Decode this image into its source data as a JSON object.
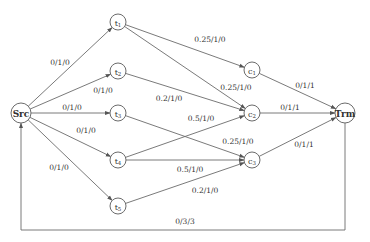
{
  "diagram": {
    "type": "flow-network",
    "nodes": [
      {
        "id": "Src",
        "label": "Src",
        "sub": "",
        "x": 21,
        "y": 113,
        "r": 10,
        "bold": true
      },
      {
        "id": "t1",
        "label": "t",
        "sub": "1",
        "x": 118,
        "y": 22,
        "r": 8
      },
      {
        "id": "t2",
        "label": "t",
        "sub": "2",
        "x": 118,
        "y": 71,
        "r": 8
      },
      {
        "id": "t3",
        "label": "t",
        "sub": "3",
        "x": 118,
        "y": 113,
        "r": 8
      },
      {
        "id": "t4",
        "label": "t",
        "sub": "4",
        "x": 118,
        "y": 160,
        "r": 8
      },
      {
        "id": "t5",
        "label": "t",
        "sub": "5",
        "x": 118,
        "y": 206,
        "r": 8
      },
      {
        "id": "c1",
        "label": "c",
        "sub": "1",
        "x": 252,
        "y": 70,
        "r": 8
      },
      {
        "id": "c2",
        "label": "c",
        "sub": "2",
        "x": 252,
        "y": 113,
        "r": 8
      },
      {
        "id": "c3",
        "label": "c",
        "sub": "3",
        "x": 252,
        "y": 160,
        "r": 8
      },
      {
        "id": "Trm",
        "label": "Trm",
        "sub": "",
        "x": 345,
        "y": 113,
        "r": 10,
        "bold": true
      }
    ],
    "edges": [
      {
        "from": "Src",
        "to": "t1",
        "label": "0/1/0",
        "lx": 60,
        "ly": 65
      },
      {
        "from": "Src",
        "to": "t2",
        "label": "0/1/0",
        "lx": 103,
        "ly": 93
      },
      {
        "from": "Src",
        "to": "t3",
        "label": "0/1/0",
        "lx": 72,
        "ly": 110
      },
      {
        "from": "Src",
        "to": "t4",
        "label": "0/1/0",
        "lx": 86,
        "ly": 133
      },
      {
        "from": "Src",
        "to": "t5",
        "label": "0/1/0",
        "lx": 59,
        "ly": 170
      },
      {
        "from": "t1",
        "to": "c1",
        "label": "0.25/1/0",
        "lx": 210,
        "ly": 42
      },
      {
        "from": "t1",
        "to": "c2",
        "label": "0.25/1/0",
        "lx": 236,
        "ly": 90
      },
      {
        "from": "t2",
        "to": "c2",
        "label": "0.2/1/0",
        "lx": 169,
        "ly": 101
      },
      {
        "from": "t3",
        "to": "c3",
        "label": "0.25/1/0",
        "lx": 238,
        "ly": 144
      },
      {
        "from": "t4",
        "to": "c2",
        "label": "0.5/1/0",
        "lx": 201,
        "ly": 121
      },
      {
        "from": "t4",
        "to": "c3",
        "label": "0.5/1/0",
        "lx": 190,
        "ly": 172
      },
      {
        "from": "t5",
        "to": "c3",
        "label": "0.2/1/0",
        "lx": 205,
        "ly": 193
      },
      {
        "from": "c1",
        "to": "Trm",
        "label": "0/1/1",
        "lx": 305,
        "ly": 88
      },
      {
        "from": "c2",
        "to": "Trm",
        "label": "0/1/1",
        "lx": 290,
        "ly": 110
      },
      {
        "from": "c3",
        "to": "Trm",
        "label": "0/1/1",
        "lx": 304,
        "ly": 147
      },
      {
        "from": "Trm",
        "to": "Src",
        "label": "0/3/3",
        "lx": 185,
        "ly": 224,
        "route": "loop-bottom",
        "loopY": 230
      }
    ]
  }
}
